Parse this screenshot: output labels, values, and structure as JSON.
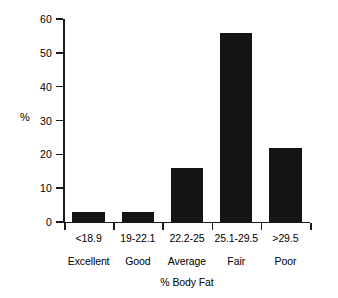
{
  "chart_data": {
    "type": "bar",
    "title": "",
    "subtitle": "",
    "xlabel": "% Body Fat",
    "ylabel": "%",
    "categories": [
      "Excellent",
      "Good",
      "Average",
      "Fair",
      "Poor"
    ],
    "category_ranges": [
      "<18.9",
      "19-22.1",
      "22.2-25",
      "25.1-29.5",
      ">29.5"
    ],
    "values": [
      3,
      3,
      16,
      56,
      22
    ],
    "ylim": [
      0,
      60
    ],
    "yticks": [
      0,
      10,
      20,
      30,
      40,
      50,
      60
    ],
    "ytick_labels": [
      "0",
      "10",
      "20",
      "30",
      "40",
      "50",
      "60"
    ],
    "grid": false,
    "legend": false,
    "bar_color": "#151515",
    "axis_color": "#1a1a1a",
    "background_color": "#ffffff"
  },
  "axes": {
    "y_title": "%",
    "x_title": "% Body Fat"
  },
  "bars": [
    {
      "category": "Excellent",
      "range": "<18.9",
      "value": 3
    },
    {
      "category": "Good",
      "range": "19-22.1",
      "value": 3
    },
    {
      "category": "Average",
      "range": "22.2-25",
      "value": 16
    },
    {
      "category": "Fair",
      "range": "25.1-29.5",
      "value": 56
    },
    {
      "category": "Poor",
      "range": ">29.5",
      "value": 22
    }
  ]
}
